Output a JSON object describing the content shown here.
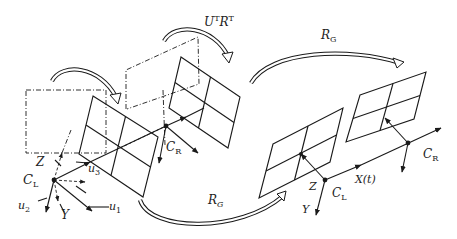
{
  "diagram": {
    "type": "stereo-camera-rectification-schematic",
    "labels": {
      "rotation_top": "U",
      "rotation_top_sup1": "T",
      "rotation_top_R": "R",
      "rotation_top_sup2": "T",
      "rg_top": "R",
      "rg_top_sub": "G",
      "rg_bottom": "R",
      "rg_bottom_sub": "G",
      "left_cam_C": "C",
      "left_cam_sub": "L",
      "left_Z": "Z",
      "left_Y": "Y",
      "u1": "u",
      "u1_sub": "1",
      "u2": "u",
      "u2_sub": "2",
      "u3": "u",
      "u3_sub": "3",
      "mid_CR": "C",
      "mid_CR_sub": "R",
      "right_CL": "C",
      "right_CL_sub": "L",
      "right_CR": "C",
      "right_CR_sub": "R",
      "right_Z": "Z",
      "right_Y": "Y",
      "baseline": "X(t)"
    },
    "elements": [
      {
        "name": "original-left-image-plane",
        "style": "dash-dot rectangle"
      },
      {
        "name": "left-image-plane",
        "style": "solid 2x2 grid parallelogram"
      },
      {
        "name": "original-right-image-plane",
        "style": "dash-dot parallelogram"
      },
      {
        "name": "right-image-plane",
        "style": "solid 2x2 grid parallelogram"
      },
      {
        "name": "rectified-left-plane",
        "style": "solid 2x2 grid parallelogram"
      },
      {
        "name": "rectified-right-plane",
        "style": "solid 2x2 grid parallelogram"
      },
      {
        "name": "curved-arrow-left",
        "meaning": "rotation of left plane"
      },
      {
        "name": "curved-arrow-top",
        "meaning": "U^T R^T rotation"
      },
      {
        "name": "curved-arrow-rg-top",
        "meaning": "R_G global rotation"
      },
      {
        "name": "curved-arrow-rg-bottom",
        "meaning": "R_G global rotation"
      }
    ]
  }
}
